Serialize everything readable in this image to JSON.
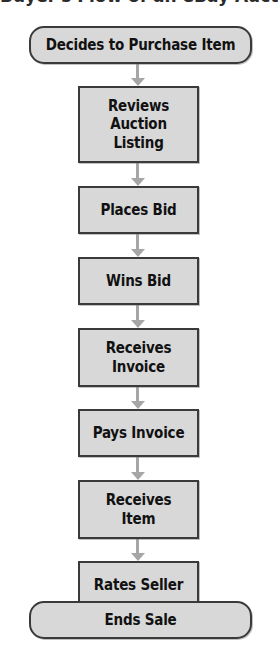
{
  "document": {
    "title": "Buyer's Flow of an eBay Auction",
    "title_visible_fragment": "",
    "background_color": "#ffffff"
  },
  "style": {
    "node_fill": "#d8d8d8",
    "node_border": "#3a3a3a",
    "text_color": "#111111",
    "arrow_color": "#a6a6a6"
  },
  "flowchart": {
    "orientation": "vertical",
    "nodes": [
      {
        "id": "decides-to-purchase-item",
        "label": "Decides to Purchase Item",
        "shape": "terminator",
        "x": 29,
        "y": 26,
        "width": 223,
        "height": 38
      },
      {
        "id": "reviews-auction-listing",
        "label": "Reviews\nAuction\nListing",
        "shape": "process",
        "x": 78,
        "y": 86,
        "width": 121,
        "height": 77
      },
      {
        "id": "places-bid",
        "label": "Places Bid",
        "shape": "process",
        "x": 78,
        "y": 186,
        "width": 121,
        "height": 48
      },
      {
        "id": "wins-bid",
        "label": "Wins Bid",
        "shape": "process",
        "x": 78,
        "y": 257,
        "width": 121,
        "height": 48
      },
      {
        "id": "receives-invoice",
        "label": "Receives\nInvoice",
        "shape": "process",
        "x": 78,
        "y": 328,
        "width": 121,
        "height": 59
      },
      {
        "id": "pays-invoice",
        "label": "Pays Invoice",
        "shape": "process",
        "x": 78,
        "y": 409,
        "width": 121,
        "height": 48
      },
      {
        "id": "receives-item",
        "label": "Receives\nItem",
        "shape": "process",
        "x": 78,
        "y": 480,
        "width": 121,
        "height": 59
      },
      {
        "id": "rates-seller",
        "label": "Rates Seller",
        "shape": "process",
        "x": 78,
        "y": 561,
        "width": 121,
        "height": 48
      },
      {
        "id": "ends-sale",
        "label": "Ends Sale",
        "shape": "terminator",
        "x": 29,
        "y": 601,
        "width": 223,
        "height": 38
      }
    ],
    "connectors": [
      {
        "id": "arrow-1",
        "from": "decides-to-purchase-item",
        "to": "reviews-auction-listing",
        "x": 138,
        "y": 64,
        "height": 22
      },
      {
        "id": "arrow-2",
        "from": "reviews-auction-listing",
        "to": "places-bid",
        "x": 138,
        "y": 163,
        "height": 23
      },
      {
        "id": "arrow-3",
        "from": "places-bid",
        "to": "wins-bid",
        "x": 138,
        "y": 234,
        "height": 23
      },
      {
        "id": "arrow-4",
        "from": "wins-bid",
        "to": "receives-invoice",
        "x": 138,
        "y": 305,
        "height": 23
      },
      {
        "id": "arrow-5",
        "from": "receives-invoice",
        "to": "pays-invoice",
        "x": 138,
        "y": 387,
        "height": 22
      },
      {
        "id": "arrow-6",
        "from": "pays-invoice",
        "to": "receives-item",
        "x": 138,
        "y": 457,
        "height": 23
      },
      {
        "id": "arrow-7",
        "from": "receives-item",
        "to": "rates-seller",
        "x": 138,
        "y": 539,
        "height": 22
      },
      {
        "id": "arrow-8",
        "from": "rates-seller",
        "to": "ends-sale",
        "x": 138,
        "y": 609,
        "height": 22
      }
    ]
  }
}
